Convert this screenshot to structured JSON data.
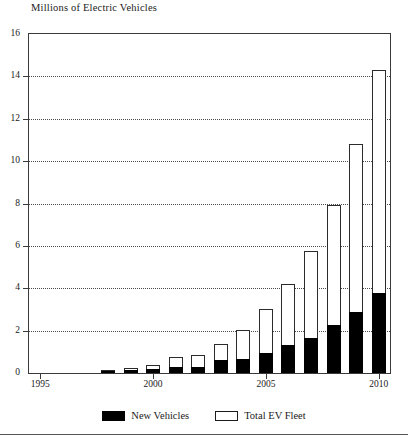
{
  "chart_data": {
    "type": "bar",
    "title": "Millions of Electric Vehicles",
    "subtitle": "",
    "xlabel": "",
    "ylabel": "",
    "stacked": false,
    "overlaid": true,
    "grid": true,
    "legend_position": "bottom",
    "ylim": [
      0,
      16
    ],
    "yticks": [
      0,
      2,
      4,
      6,
      8,
      10,
      12,
      14,
      16
    ],
    "ytick_labels": [
      "0",
      "2",
      "4",
      "6",
      "8",
      "10",
      "12",
      "14",
      "16"
    ],
    "xlim": [
      1994.5,
      2010.5
    ],
    "xticks": [
      1995,
      2000,
      2005,
      2010
    ],
    "xtick_labels": [
      "1995",
      "2000",
      "2005",
      "2010"
    ],
    "categories": [
      1995,
      1996,
      1997,
      1998,
      1999,
      2000,
      2001,
      2002,
      2003,
      2004,
      2005,
      2006,
      2007,
      2008,
      2009,
      2010
    ],
    "series": [
      {
        "name": "Total EV Fleet",
        "style": "hollow",
        "values": [
          0,
          0,
          0,
          0.15,
          0.25,
          0.4,
          0.75,
          0.85,
          1.35,
          2.05,
          3.0,
          4.2,
          5.75,
          7.95,
          10.8,
          14.3
        ]
      },
      {
        "name": "New Vehicles",
        "style": "filled",
        "values": [
          0,
          0,
          0,
          0.1,
          0.15,
          0.2,
          0.3,
          0.3,
          0.6,
          0.65,
          0.95,
          1.3,
          1.65,
          2.25,
          2.9,
          3.8
        ]
      }
    ]
  },
  "legend": {
    "items": [
      {
        "label": "New Vehicles",
        "style": "filled"
      },
      {
        "label": "Total EV Fleet",
        "style": "hollow"
      }
    ]
  }
}
